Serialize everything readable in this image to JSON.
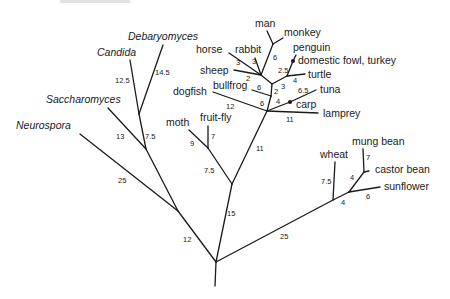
{
  "diagram": {
    "type": "phylogenetic-tree",
    "colors": {
      "line": "#1a1a1a",
      "background": "#ffffff"
    },
    "taxa": {
      "neurospora": "Neurospora",
      "saccharomyces": "Saccharomyces",
      "candida": "Candida",
      "debaryomyces": "Debaryomyces",
      "moth": "moth",
      "fruit_fly": "fruit-fly",
      "dogfish": "dogfish",
      "bullfrog": "bullfrog",
      "sheep": "sheep",
      "horse": "horse",
      "rabbit": "rabbit",
      "man": "man",
      "monkey": "monkey",
      "penguin": "penguin",
      "fowl": "domestic fowl, turkey",
      "turtle": "turtle",
      "tuna": "tuna",
      "carp": "carp",
      "lamprey": "lamprey",
      "wheat": "wheat",
      "mung_bean": "mung bean",
      "castor_bean": "castor bean",
      "sunflower": "sunflower"
    },
    "branch_lengths": {
      "root_fungi": "12",
      "neurospora": "25",
      "sacch_stem": "7.5",
      "saccharomyces": "13",
      "candida": "12.5",
      "debaryomyces": "14.5",
      "root_animal": "15",
      "insect_stem": "7.5",
      "moth": "9",
      "fruit_fly": "7",
      "vertebrate_stem": "11",
      "dogfish": "12",
      "lamprey": "11",
      "fish_stem": "4",
      "tuna": "6.5",
      "tetrapod_stem": "6",
      "bullfrog": "6",
      "amniote_stem": "2",
      "mammal_stem": "2",
      "sheep": "2",
      "horse": "3",
      "rabbit": "3",
      "primate_stem": "6",
      "reptbird_stem": "3",
      "turtle": "4",
      "birds": "2.5",
      "root_plant": "25",
      "wheat": "7.5",
      "plant_inner": "4",
      "castor_stem": "4",
      "mung_bean": "7",
      "sunflower": "6"
    }
  }
}
